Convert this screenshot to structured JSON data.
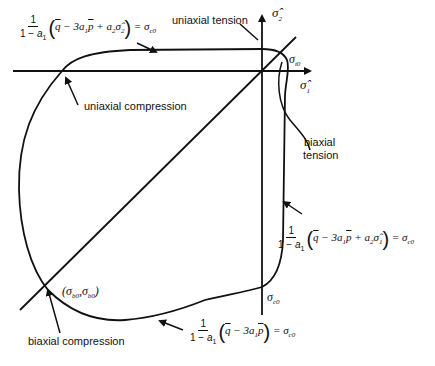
{
  "diagram": {
    "axes": {
      "x_label": "σ̂1",
      "y_label": "σ̂2"
    },
    "points": {
      "sigma_t0": "σt0",
      "sigma_c0_bottom": "σc0",
      "sigma_b0": "(σb0,σb0)"
    },
    "annotations": {
      "uniaxial_tension": "uniaxial tension",
      "uniaxial_compression": "uniaxial compression",
      "biaxial_tension_line1": "biaxial",
      "biaxial_tension_line2": "tension",
      "biaxial_compression": "biaxial compression"
    },
    "equations": {
      "top": {
        "numerator": "1",
        "denominator": "1 − a1",
        "expression": "q̄ − 3a1p̄ + a2σ̂2",
        "rhs": "= σc0"
      },
      "right": {
        "numerator": "1",
        "denominator": "1 − a1",
        "expression": "q̄ − 3a1p̄ + a2σ̂1",
        "rhs": "= σc0"
      },
      "bottom": {
        "numerator": "1",
        "denominator": "1 − a1",
        "expression": "q̄ − 3a1p̄",
        "rhs": "= σc0"
      }
    },
    "colors": {
      "stroke": "#111111",
      "background": "#ffffff"
    }
  }
}
